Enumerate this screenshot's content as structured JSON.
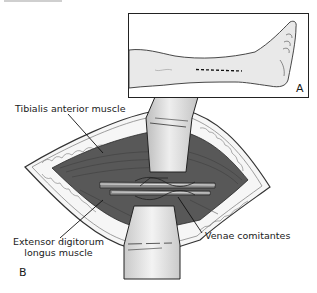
{
  "figure": {
    "panels": [
      {
        "id": "A",
        "label": "A",
        "description": "Leg in lateral view with dashed incision line along anterolateral shin"
      },
      {
        "id": "B",
        "label": "B",
        "description": "Surgical exposure between retractors showing muscles and vessels"
      }
    ],
    "labels": {
      "tibialis": "Tibialis anterior muscle",
      "extensor_line1": "Extensor digitorum",
      "extensor_line2": "longus muscle",
      "venae": "Venae comitantes"
    },
    "colors": {
      "muscle": "#555555",
      "muscle_dark": "#3e3e3e",
      "fat": "#f4f4f4",
      "skin_edge": "#9a9a9a",
      "retractor": "#d2d2d2",
      "leg_fill": "#ececec",
      "outline": "#222222"
    }
  }
}
